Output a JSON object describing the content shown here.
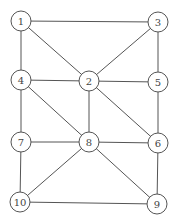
{
  "graph": {
    "node_radius": 10,
    "nodes": [
      {
        "id": "1",
        "label": "1",
        "x": 21,
        "y": 21
      },
      {
        "id": "3",
        "label": "3",
        "x": 158,
        "y": 22
      },
      {
        "id": "4",
        "label": "4",
        "x": 21,
        "y": 80
      },
      {
        "id": "2",
        "label": "2",
        "x": 89,
        "y": 81
      },
      {
        "id": "5",
        "label": "5",
        "x": 158,
        "y": 82
      },
      {
        "id": "7",
        "label": "7",
        "x": 21,
        "y": 142
      },
      {
        "id": "8",
        "label": "8",
        "x": 89,
        "y": 142
      },
      {
        "id": "6",
        "label": "6",
        "x": 158,
        "y": 143
      },
      {
        "id": "10",
        "label": "10",
        "x": 20,
        "y": 202
      },
      {
        "id": "9",
        "label": "9",
        "x": 157,
        "y": 204
      }
    ],
    "edges": [
      [
        "1",
        "3"
      ],
      [
        "1",
        "4"
      ],
      [
        "1",
        "2"
      ],
      [
        "3",
        "2"
      ],
      [
        "3",
        "5"
      ],
      [
        "4",
        "2"
      ],
      [
        "2",
        "5"
      ],
      [
        "4",
        "7"
      ],
      [
        "4",
        "8"
      ],
      [
        "2",
        "8"
      ],
      [
        "2",
        "6"
      ],
      [
        "5",
        "6"
      ],
      [
        "7",
        "8"
      ],
      [
        "8",
        "6"
      ],
      [
        "7",
        "10"
      ],
      [
        "8",
        "10"
      ],
      [
        "8",
        "9"
      ],
      [
        "6",
        "9"
      ],
      [
        "10",
        "9"
      ]
    ]
  }
}
